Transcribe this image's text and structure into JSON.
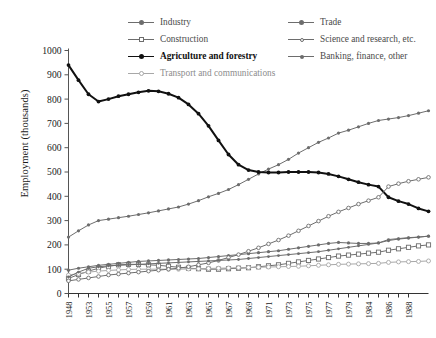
{
  "chart_data": {
    "type": "line",
    "title": "",
    "xlabel": "",
    "ylabel": "Employment  (thousands)",
    "ylim": [
      0,
      1000
    ],
    "yticks": [
      0,
      100,
      200,
      300,
      400,
      500,
      600,
      700,
      800,
      900,
      1000
    ],
    "grid": false,
    "legend_position": "top",
    "x": [
      1948,
      1949,
      1950,
      1951,
      1952,
      1953,
      1954,
      1955,
      1956,
      1957,
      1958,
      1959,
      1960,
      1961,
      1962,
      1963,
      1964,
      1965,
      1966,
      1967,
      1968,
      1969,
      1970,
      1971,
      1972,
      1973,
      1974,
      1975,
      1976,
      1977,
      1978,
      1979,
      1984,
      1985,
      1986,
      1987,
      1988
    ],
    "xtick_labels": [
      "1948",
      "",
      "1953",
      "",
      "1955",
      "",
      "1957",
      "",
      "1959",
      "",
      "1961",
      "",
      "1963",
      "",
      "1965",
      "",
      "1967",
      "",
      "1969",
      "",
      "1971",
      "",
      "1973",
      "",
      "1975",
      "",
      "1977",
      "",
      "1979",
      "",
      "1984",
      "",
      "1986",
      "",
      "1988"
    ],
    "xtick_labels_shown": [
      "1948",
      "1953",
      "1955",
      "1957",
      "1959",
      "1961",
      "1963",
      "1965",
      "1967",
      "1969",
      "1971",
      "1973",
      "1975",
      "1977",
      "1979",
      "1984",
      "1986",
      "1988"
    ],
    "series": [
      {
        "name": "Industry",
        "color": "#6d6d6d",
        "marker": "filled-circle",
        "width": 1,
        "values": [
          232,
          258,
          282,
          300,
          306,
          312,
          318,
          325,
          332,
          340,
          348,
          356,
          368,
          382,
          398,
          412,
          428,
          448,
          470,
          492,
          512,
          530,
          552,
          578,
          600,
          622,
          640,
          660,
          672,
          686,
          700,
          712,
          718,
          724,
          732,
          742,
          752
        ]
      },
      {
        "name": "Construction",
        "color": "#6d6d6d",
        "marker": "open-square",
        "width": 1,
        "values": [
          62,
          78,
          92,
          104,
          112,
          118,
          120,
          120,
          118,
          116,
          112,
          108,
          104,
          102,
          100,
          100,
          102,
          104,
          106,
          110,
          114,
          118,
          124,
          130,
          136,
          142,
          148,
          154,
          158,
          162,
          166,
          170,
          178,
          184,
          190,
          196,
          200
        ]
      },
      {
        "name": "Agriculture and forestry",
        "color": "#111111",
        "marker": "filled-circle",
        "width": 2,
        "values": [
          940,
          878,
          820,
          790,
          800,
          812,
          820,
          828,
          834,
          832,
          822,
          806,
          778,
          740,
          690,
          630,
          572,
          530,
          508,
          500,
          498,
          498,
          500,
          500,
          500,
          498,
          492,
          482,
          470,
          458,
          448,
          440,
          396,
          380,
          368,
          350,
          338
        ]
      },
      {
        "name": "Transport and communications",
        "color": "#a8a8a8",
        "marker": "open-circle",
        "width": 1,
        "values": [
          76,
          82,
          88,
          92,
          95,
          97,
          99,
          100,
          100,
          100,
          100,
          100,
          101,
          102,
          103,
          104,
          105,
          106,
          107,
          108,
          109,
          110,
          111,
          112,
          114,
          116,
          118,
          120,
          121,
          122,
          123,
          124,
          128,
          130,
          131,
          132,
          134
        ]
      },
      {
        "name": "Trade",
        "color": "#6d6d6d",
        "marker": "filled-circle",
        "width": 1,
        "values": [
          96,
          104,
          110,
          116,
          120,
          124,
          128,
          132,
          134,
          136,
          138,
          140,
          142,
          144,
          148,
          152,
          156,
          160,
          164,
          168,
          172,
          176,
          182,
          188,
          194,
          200,
          206,
          210,
          208,
          206,
          206,
          208,
          218,
          224,
          228,
          232,
          236
        ]
      },
      {
        "name": "Science and research, etc.",
        "color": "#6d6d6d",
        "marker": "open-circle-small",
        "width": 1,
        "values": [
          52,
          58,
          64,
          70,
          76,
          80,
          84,
          88,
          92,
          96,
          100,
          104,
          110,
          118,
          126,
          136,
          148,
          160,
          174,
          188,
          204,
          220,
          238,
          258,
          278,
          298,
          318,
          336,
          352,
          368,
          382,
          396,
          440,
          452,
          462,
          470,
          478
        ]
      },
      {
        "name": "Banking, finance, other",
        "color": "#6d6d6d",
        "marker": "filled-circle-small",
        "width": 1,
        "values": [
          68,
          88,
          104,
          110,
          114,
          116,
          118,
          120,
          122,
          124,
          126,
          128,
          130,
          132,
          134,
          136,
          138,
          140,
          144,
          148,
          152,
          156,
          160,
          164,
          168,
          172,
          178,
          184,
          190,
          196,
          202,
          208,
          222,
          226,
          230,
          232,
          236
        ]
      }
    ]
  },
  "legend": {
    "left": [
      {
        "label": "Industry",
        "style": "normal",
        "marker": "filled-circle",
        "color": "#6d6d6d"
      },
      {
        "label": "Construction",
        "style": "normal",
        "marker": "open-square",
        "color": "#6d6d6d"
      },
      {
        "label": "Agriculture and forestry",
        "style": "bold",
        "marker": "filled-circle",
        "color": "#111111"
      },
      {
        "label": "Transport and communications",
        "style": "pale",
        "marker": "open-circle",
        "color": "#a8a8a8"
      }
    ],
    "right": [
      {
        "label": "Trade",
        "style": "normal",
        "marker": "filled-circle",
        "color": "#6d6d6d"
      },
      {
        "label": "Science and research, etc.",
        "style": "normal",
        "marker": "open-circle-small",
        "color": "#6d6d6d"
      },
      {
        "label": "Banking, finance, other",
        "style": "normal",
        "marker": "filled-circle-small",
        "color": "#6d6d6d"
      }
    ]
  },
  "axes": {
    "y_title": "Employment  (thousands)"
  }
}
